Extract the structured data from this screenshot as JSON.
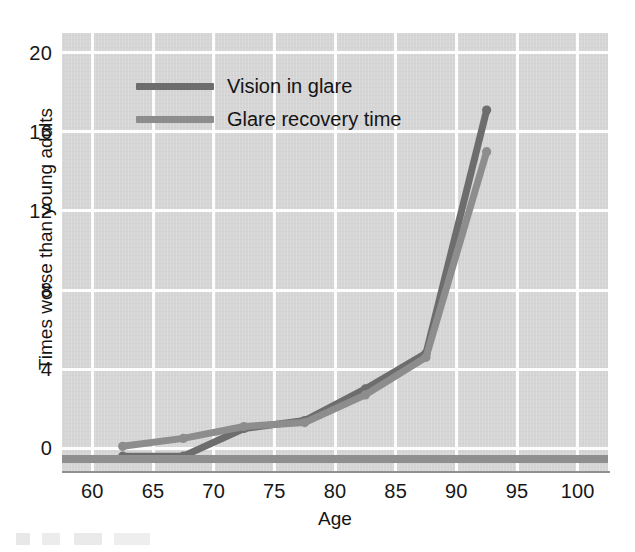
{
  "chart_data": {
    "type": "line",
    "title": "",
    "xlabel": "Age",
    "ylabel": "Times worse than young adults",
    "xlim": [
      57.5,
      102.5
    ],
    "ylim": [
      -1.2,
      21.0
    ],
    "xticks": [
      60,
      65,
      70,
      75,
      80,
      85,
      90,
      95,
      100
    ],
    "yticks": [
      0,
      4,
      8,
      12,
      16,
      20
    ],
    "grid": true,
    "legend_position": "upper-left-inside",
    "x": [
      62.5,
      67.5,
      72.5,
      77.5,
      82.5,
      87.5,
      92.5
    ],
    "series": [
      {
        "name": "Vision in glare",
        "color": "#6d6d6d",
        "values": [
          -0.4,
          -0.4,
          1.0,
          1.4,
          3.0,
          4.8,
          17.1
        ]
      },
      {
        "name": "Glare recovery time",
        "color": "#8d8d8d",
        "values": [
          0.1,
          0.5,
          1.1,
          1.3,
          2.7,
          4.6,
          15.0
        ]
      }
    ]
  },
  "axes": {
    "ylabel": "Times worse than young adults",
    "xlabel": "Age",
    "ytick_labels": [
      "0",
      "4",
      "8",
      "12",
      "16",
      "20"
    ],
    "xtick_labels": [
      "60",
      "65",
      "70",
      "75",
      "80",
      "85",
      "90",
      "95",
      "100"
    ]
  },
  "legend": {
    "items": [
      {
        "label": "Vision in glare",
        "color": "#6d6d6d"
      },
      {
        "label": "Glare recovery time",
        "color": "#8d8d8d"
      }
    ]
  },
  "colors": {
    "plot_background": "#d5d5d5",
    "gridline": "#fdfdfd",
    "baseline_rule": "#8f8f8f",
    "axis_spine": "#909090",
    "text": "#141414",
    "series_vision_in_glare": "#6d6d6d",
    "series_glare_recovery_time": "#8d8d8d"
  }
}
